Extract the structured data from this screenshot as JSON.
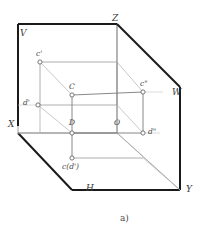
{
  "figure": {
    "caption": "a)",
    "colors": {
      "plane_edge_dark": "#1a1a1a",
      "plane_edge_light": "#8c8c8c",
      "wireframe": "#7a7a7a",
      "projector": "#b0b0b0",
      "label_text": "#3a3a3a",
      "background": "#ffffff"
    },
    "plane_labels": [
      {
        "id": "V",
        "text": "V",
        "x": 20,
        "y": 29
      },
      {
        "id": "H",
        "text": "H",
        "x": 86,
        "y": 184
      },
      {
        "id": "W",
        "text": "W",
        "x": 172,
        "y": 88
      }
    ],
    "axis_labels": [
      {
        "id": "X",
        "text": "X",
        "x": 8,
        "y": 120
      },
      {
        "id": "Y",
        "text": "Y",
        "x": 186,
        "y": 185
      },
      {
        "id": "Z",
        "text": "Z",
        "x": 112,
        "y": 14
      }
    ],
    "point_labels": [
      {
        "id": "c-prime",
        "text": "c'",
        "x": 36,
        "y": 50
      },
      {
        "id": "C",
        "text": "C",
        "x": 69,
        "y": 83
      },
      {
        "id": "c-double-prime",
        "text": "c\"",
        "x": 140,
        "y": 80
      },
      {
        "id": "d-prime",
        "text": "d'",
        "x": 23,
        "y": 99
      },
      {
        "id": "D",
        "text": "D",
        "x": 69,
        "y": 119
      },
      {
        "id": "O",
        "text": "O",
        "x": 114,
        "y": 119
      },
      {
        "id": "d-double-prime",
        "text": "d\"",
        "x": 148,
        "y": 128
      },
      {
        "id": "c-d-prime",
        "text": "c(d')",
        "x": 62,
        "y": 163
      }
    ],
    "points": [
      {
        "id": "c-prime",
        "x": 40,
        "y": 62
      },
      {
        "id": "C",
        "x": 72,
        "y": 95
      },
      {
        "id": "c-double-prime",
        "x": 143,
        "y": 92
      },
      {
        "id": "d-prime",
        "x": 38,
        "y": 105
      },
      {
        "id": "D",
        "x": 72,
        "y": 133
      },
      {
        "id": "d-double-prime",
        "x": 143,
        "y": 133
      },
      {
        "id": "c-bottom",
        "x": 72,
        "y": 158
      }
    ]
  }
}
